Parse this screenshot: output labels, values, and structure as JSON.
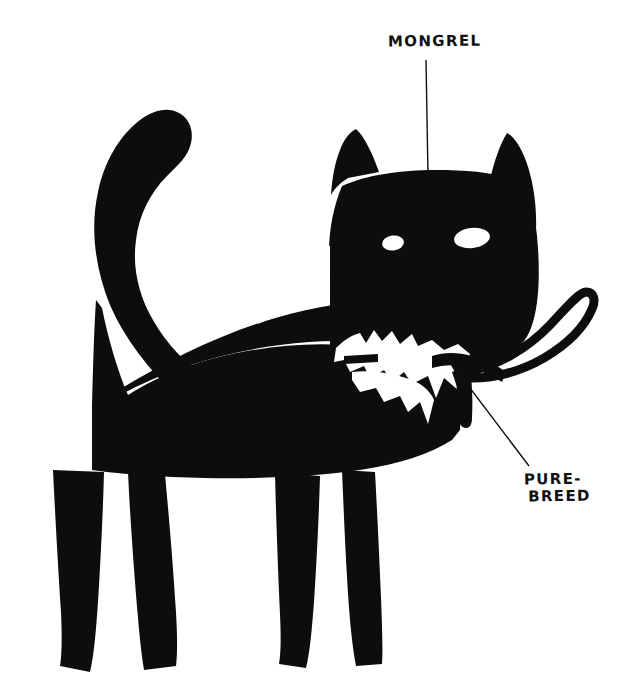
{
  "illustration": {
    "title": "Cat silhouette with breed annotations",
    "subject": "cat",
    "style": "hand-drawn black ink silhouette on white",
    "background_color": "#ffffff",
    "ink_color": "#0d0d0d",
    "eye_color": "#ffffff"
  },
  "annotations": [
    {
      "id": "mongrel",
      "text": "MONGREL",
      "points_to": "cat-head",
      "leader_line": {
        "x1": 426,
        "y1": 60,
        "x2": 428,
        "y2": 176
      }
    },
    {
      "id": "purebreed",
      "line1": "PURE-",
      "line2": "BREED",
      "points_to": "collar-tag",
      "leader_line": {
        "x1": 445,
        "y1": 355,
        "x2": 529,
        "y2": 466
      }
    }
  ],
  "figure_parts": [
    {
      "name": "tail",
      "description": "long tail curving up and to the left"
    },
    {
      "name": "body",
      "description": "solid black torso"
    },
    {
      "name": "front-legs",
      "description": "two front legs with splayed paws"
    },
    {
      "name": "hind-legs",
      "description": "two hind legs with splayed paws"
    },
    {
      "name": "head",
      "description": "broad head with two pointed ears"
    },
    {
      "name": "left-ear",
      "description": "pointed triangular ear"
    },
    {
      "name": "right-ear",
      "description": "pointed triangular ear"
    },
    {
      "name": "left-eye",
      "description": "small white oval eye"
    },
    {
      "name": "right-eye",
      "description": "larger white oval eye"
    },
    {
      "name": "chest-patch",
      "description": "jagged white patch on chest and ruff"
    },
    {
      "name": "collar",
      "description": "collar around the neck"
    },
    {
      "name": "collar-tag",
      "description": "small tag hanging from the collar"
    },
    {
      "name": "leash",
      "description": "looped leash extending to the right"
    }
  ]
}
